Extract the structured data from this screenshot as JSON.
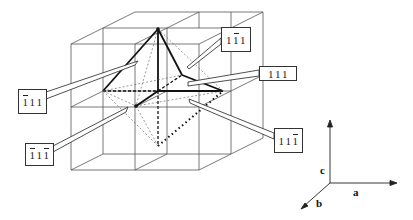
{
  "figure": {
    "labels": [
      {
        "id": "top-right",
        "text": "1̅1 1",
        "digits": [
          {
            "d": "1",
            "bar": false
          },
          {
            "d": "1",
            "bar": true
          },
          {
            "d": "1",
            "bar": false
          }
        ],
        "box": {
          "x": 221,
          "y": 27,
          "w": 30,
          "h": 25
        }
      },
      {
        "id": "right",
        "text": "111",
        "digits": [
          {
            "d": "1",
            "bar": false
          },
          {
            "d": "1",
            "bar": false
          },
          {
            "d": "1",
            "bar": false
          }
        ],
        "box": {
          "x": 259,
          "y": 66,
          "w": 38,
          "h": 15
        }
      },
      {
        "id": "lower-right",
        "text": "11̅1",
        "digits": [
          {
            "d": "1",
            "bar": false
          },
          {
            "d": "1",
            "bar": false
          },
          {
            "d": "1",
            "bar": true
          }
        ],
        "box": {
          "x": 274,
          "y": 128,
          "w": 29,
          "h": 25
        }
      },
      {
        "id": "left-upper",
        "text": "̅1 1 1",
        "digits": [
          {
            "d": "1",
            "bar": true
          },
          {
            "d": "1",
            "bar": false
          },
          {
            "d": "1",
            "bar": false
          }
        ],
        "box": {
          "x": 18,
          "y": 89,
          "w": 29,
          "h": 25
        }
      },
      {
        "id": "left-lower",
        "text": "̅1 1 ̅1",
        "digits": [
          {
            "d": "1",
            "bar": true
          },
          {
            "d": "1",
            "bar": false
          },
          {
            "d": "1",
            "bar": true
          }
        ],
        "box": {
          "x": 25,
          "y": 143,
          "w": 29,
          "h": 23
        }
      }
    ],
    "axes": {
      "a": "a",
      "b": "b",
      "c": "c"
    },
    "colors": {
      "line": "#333333",
      "bold": "#111111",
      "background": "#ffffff"
    }
  }
}
